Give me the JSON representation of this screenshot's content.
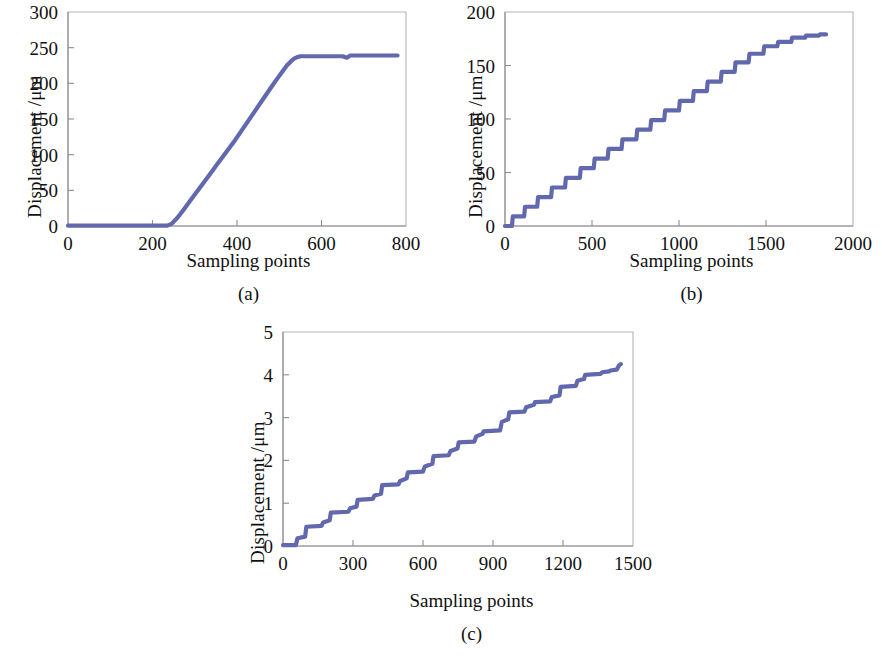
{
  "figure": {
    "background": "#ffffff",
    "series_color": "#6168ae",
    "axis_color": "#8d8d8d",
    "frame_color": "#b5b5b5"
  },
  "panels": [
    {
      "id": "a",
      "caption": "(a)",
      "ylabel": "Displacement /μm",
      "xlabel": "Sampling points"
    },
    {
      "id": "b",
      "caption": "(b)",
      "ylabel": "Displacement /μm",
      "xlabel": "Sampling points"
    },
    {
      "id": "c",
      "caption": "(c)",
      "ylabel": "Displacement /μm",
      "xlabel": "Sampling points"
    }
  ],
  "chart_data": [
    {
      "type": "line",
      "panel": "a",
      "title": "(a)",
      "xlabel": "Sampling points",
      "ylabel": "Displacement /μm",
      "xlim": [
        0,
        800
      ],
      "ylim": [
        0,
        300
      ],
      "xticks": [
        0,
        200,
        400,
        600,
        800
      ],
      "yticks": [
        0,
        50,
        100,
        150,
        200,
        250,
        300
      ],
      "xtick_labels": [
        "0",
        "200",
        "400",
        "600",
        "800"
      ],
      "ytick_labels": [
        "0",
        "50",
        "100",
        "150",
        "200",
        "250",
        "300"
      ],
      "grid": false,
      "legend": "none",
      "series": [
        {
          "name": "displacement",
          "color": "#6168ae",
          "x": [
            0,
            30,
            60,
            90,
            120,
            150,
            180,
            210,
            235,
            245,
            255,
            265,
            275,
            290,
            305,
            320,
            335,
            350,
            365,
            380,
            395,
            410,
            425,
            440,
            455,
            470,
            485,
            497,
            508,
            518,
            528,
            536,
            544,
            550,
            558,
            570,
            590,
            610,
            630,
            650,
            660,
            668,
            690,
            720,
            750,
            780
          ],
          "y": [
            0.5,
            0.5,
            0.5,
            0.5,
            0.5,
            0.5,
            0.5,
            0.5,
            0.5,
            3,
            9,
            16,
            24,
            36,
            48,
            60,
            72,
            84,
            96,
            108,
            120,
            133,
            146,
            159,
            172,
            185,
            198,
            208,
            217,
            225,
            231,
            235,
            237,
            238,
            238,
            238,
            238,
            238,
            238,
            238,
            236,
            239,
            239,
            239,
            239,
            239
          ]
        }
      ]
    },
    {
      "type": "line",
      "panel": "b",
      "title": "(b)",
      "xlabel": "Sampling points",
      "ylabel": "Displacement /μm",
      "xlim": [
        0,
        2000
      ],
      "ylim": [
        0,
        200
      ],
      "xticks": [
        0,
        500,
        1000,
        1500,
        2000
      ],
      "yticks": [
        0,
        50,
        100,
        150,
        200
      ],
      "xtick_labels": [
        "0",
        "500",
        "1000",
        "1500",
        "2000"
      ],
      "ytick_labels": [
        "0",
        "50",
        "100",
        "150",
        "200"
      ],
      "grid": false,
      "legend": "none",
      "description": "staircase, ~19 steps of about 9-10 um each",
      "series": [
        {
          "name": "displacement",
          "color": "#6168ae",
          "step": "post",
          "x": [
            0,
            40,
            45,
            110,
            115,
            185,
            190,
            265,
            270,
            345,
            350,
            430,
            435,
            510,
            515,
            590,
            595,
            670,
            675,
            755,
            760,
            835,
            840,
            915,
            920,
            1000,
            1005,
            1080,
            1085,
            1160,
            1165,
            1240,
            1245,
            1320,
            1325,
            1400,
            1405,
            1485,
            1490,
            1565,
            1570,
            1645,
            1650,
            1725,
            1730,
            1805,
            1810,
            1845
          ],
          "y": [
            0,
            0,
            9,
            9,
            18,
            18,
            27,
            27,
            36,
            36,
            45,
            45,
            54,
            54,
            63,
            63,
            72,
            72,
            81,
            81,
            90,
            90,
            99,
            99,
            108,
            108,
            117,
            117,
            126,
            126,
            135,
            135,
            144,
            144,
            153,
            153,
            161,
            161,
            168,
            168,
            172,
            172,
            176,
            176,
            178,
            178,
            179,
            179
          ]
        }
      ]
    },
    {
      "type": "line",
      "panel": "c",
      "title": "(c)",
      "xlabel": "Sampling points",
      "ylabel": "Displacement /μm",
      "xlim": [
        0,
        1500
      ],
      "ylim": [
        0,
        5
      ],
      "xticks": [
        0,
        300,
        600,
        900,
        1200,
        1500
      ],
      "yticks": [
        0,
        1,
        2,
        3,
        4,
        5
      ],
      "xtick_labels": [
        "0",
        "300",
        "600",
        "900",
        "1200",
        "1500"
      ],
      "ytick_labels": [
        "0",
        "1",
        "2",
        "3",
        "4",
        "5"
      ],
      "grid": false,
      "legend": "none",
      "description": "staircase, ~15 steps of about 0.28 um each",
      "series": [
        {
          "name": "displacement",
          "color": "#6168ae",
          "step": "post",
          "x": [
            0,
            55,
            62,
            95,
            100,
            165,
            172,
            200,
            205,
            280,
            288,
            315,
            320,
            385,
            392,
            420,
            425,
            495,
            502,
            530,
            535,
            600,
            608,
            640,
            645,
            710,
            718,
            748,
            753,
            820,
            828,
            855,
            860,
            930,
            938,
            965,
            970,
            1035,
            1042,
            1075,
            1080,
            1145,
            1152,
            1185,
            1190,
            1255,
            1262,
            1290,
            1295,
            1360,
            1368,
            1398,
            1403,
            1430,
            1440,
            1448
          ],
          "y": [
            0.02,
            0.02,
            0.18,
            0.22,
            0.45,
            0.47,
            0.55,
            0.6,
            0.78,
            0.8,
            0.88,
            0.92,
            1.08,
            1.1,
            1.18,
            1.22,
            1.42,
            1.44,
            1.52,
            1.58,
            1.72,
            1.74,
            1.86,
            1.92,
            2.1,
            2.12,
            2.22,
            2.28,
            2.42,
            2.44,
            2.56,
            2.62,
            2.68,
            2.7,
            2.9,
            2.96,
            3.12,
            3.14,
            3.24,
            3.3,
            3.36,
            3.38,
            3.48,
            3.52,
            3.72,
            3.74,
            3.86,
            3.9,
            4.0,
            4.02,
            4.06,
            4.08,
            4.1,
            4.12,
            4.22,
            4.25
          ]
        }
      ]
    }
  ]
}
